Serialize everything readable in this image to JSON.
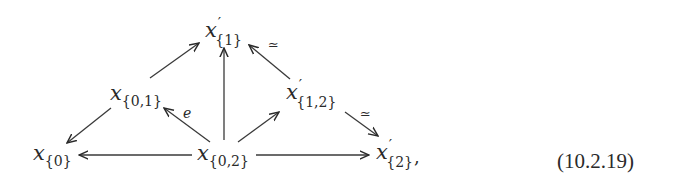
{
  "diagram": {
    "type": "commutative-diagram",
    "nodes": [
      {
        "id": "x0",
        "base": "x",
        "prime": "",
        "sub": "{0}",
        "suffix": ""
      },
      {
        "id": "x01",
        "base": "x",
        "prime": "",
        "sub": "{0,1}",
        "suffix": ""
      },
      {
        "id": "x02",
        "base": "x",
        "prime": "",
        "sub": "{0,2}",
        "suffix": ""
      },
      {
        "id": "xp1",
        "base": "x",
        "prime": "′",
        "sub": "{1}",
        "suffix": ""
      },
      {
        "id": "xp12",
        "base": "x",
        "prime": "′",
        "sub": "{1,2}",
        "suffix": ""
      },
      {
        "id": "xp2",
        "base": "x",
        "prime": "′",
        "sub": "{2}",
        "suffix": ","
      }
    ],
    "edges": [
      {
        "from": "x01",
        "to": "x0",
        "label": ""
      },
      {
        "from": "x01",
        "to": "xp1",
        "label": ""
      },
      {
        "from": "x02",
        "to": "x0",
        "label": ""
      },
      {
        "from": "x02",
        "to": "x01",
        "label": "e"
      },
      {
        "from": "x02",
        "to": "xp1",
        "label": ""
      },
      {
        "from": "x02",
        "to": "xp12",
        "label": ""
      },
      {
        "from": "x02",
        "to": "xp2",
        "label": ""
      },
      {
        "from": "xp12",
        "to": "xp1",
        "label": "≃"
      },
      {
        "from": "xp12",
        "to": "xp2",
        "label": "≃"
      }
    ],
    "labels": {
      "e": "e",
      "simeq_top": "≃",
      "simeq_right": "≃"
    },
    "equation_number": "(10.2.19)",
    "colors": {
      "ink": "#2a2a2a",
      "background": "#ffffff"
    }
  }
}
